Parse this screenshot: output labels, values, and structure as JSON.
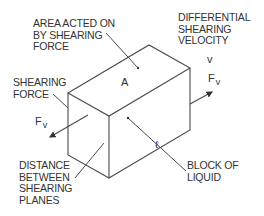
{
  "diagram": {
    "labels": {
      "area": [
        "AREA ACTED ON",
        "BY SHEARING",
        "FORCE"
      ],
      "velocity": [
        "DIFFERENTIAL",
        "SHEARING",
        "VELOCITY"
      ],
      "shearing_force": [
        "SHEARING",
        "FORCE"
      ],
      "distance": [
        "DISTANCE",
        "BETWEEN",
        "SHEARING",
        "PLANES"
      ],
      "block": [
        "BLOCK OF",
        "LIQUID"
      ]
    },
    "symbols": {
      "area": "A",
      "velocity": "v",
      "force_main": "F",
      "force_sub": "v",
      "distance": "ℓ"
    },
    "colors": {
      "line": "#4a4a4a",
      "text": "#333333",
      "background": "#ffffff"
    }
  }
}
